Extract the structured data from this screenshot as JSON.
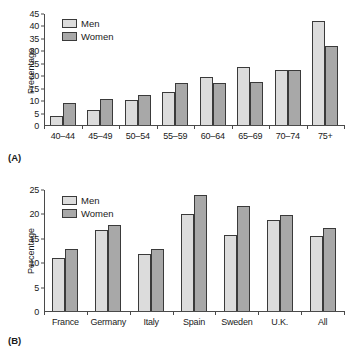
{
  "figure": {
    "background": "#ffffff",
    "series_colors": {
      "men": "#dcdcdc",
      "women": "#a8a8a8",
      "outline": "#3a3a3a",
      "axis": "#4a4a4a"
    }
  },
  "panel_a": {
    "tag": "(A)",
    "legend": {
      "men": "Men",
      "women": "Women"
    }
  },
  "panel_b": {
    "tag": "(B)",
    "legend": {
      "men": "Men",
      "women": "Women"
    }
  },
  "chart_data": [
    {
      "id": "panel-a",
      "panel": "(A)",
      "type": "bar",
      "title": "",
      "xlabel": "",
      "ylabel": "Precentage",
      "ylim": [
        0,
        45
      ],
      "yticks": [
        0,
        5,
        10,
        15,
        20,
        25,
        30,
        35,
        40,
        45
      ],
      "ytick_labels": [
        "0",
        "5",
        "10",
        "15",
        "20",
        "25",
        "30",
        "35",
        "40",
        "45"
      ],
      "grid": false,
      "legend_position": "upper left",
      "categories": [
        "40–44",
        "45–49",
        "50–54",
        "55–59",
        "60–64",
        "65–69",
        "70–74",
        "75+"
      ],
      "series": [
        {
          "name": "Men",
          "values": [
            3.5,
            6.0,
            10.0,
            13.5,
            19.5,
            23.5,
            22.3,
            42.0
          ]
        },
        {
          "name": "Women",
          "values": [
            9.0,
            10.7,
            12.1,
            17.0,
            17.0,
            17.6,
            22.5,
            32.0
          ]
        }
      ]
    },
    {
      "id": "panel-b",
      "panel": "(B)",
      "type": "bar",
      "title": "",
      "xlabel": "",
      "ylabel": "Percentage",
      "ylim": [
        0,
        25
      ],
      "yticks": [
        0,
        5,
        10,
        15,
        20,
        25
      ],
      "ytick_labels": [
        "0",
        "5",
        "10",
        "15",
        "20",
        "25"
      ],
      "grid": false,
      "legend_position": "upper left",
      "categories": [
        "France",
        "Germany",
        "Italy",
        "Spain",
        "Sweden",
        "U.K.",
        "All"
      ],
      "series": [
        {
          "name": "Men",
          "values": [
            10.9,
            16.8,
            11.8,
            20.0,
            15.8,
            18.8,
            15.4
          ]
        },
        {
          "name": "Women",
          "values": [
            12.9,
            17.8,
            12.8,
            23.9,
            21.8,
            19.9,
            17.2
          ]
        }
      ]
    }
  ]
}
